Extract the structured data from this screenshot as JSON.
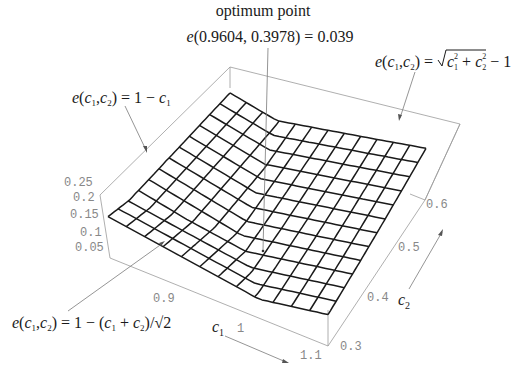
{
  "chart_data": {
    "type": "surface3d",
    "title": "",
    "xlabel": "c1",
    "ylabel": "c2",
    "zlabel": "",
    "x_range": [
      0.85,
      1.1
    ],
    "y_range": [
      0.3,
      0.6
    ],
    "z_range": [
      0.03,
      0.25
    ],
    "x_ticks": [
      "0.9",
      "1",
      "1.1"
    ],
    "y_ticks": [
      "0.3",
      "0.4",
      "0.5",
      "0.6"
    ],
    "z_ticks": [
      "0.05",
      "0.1",
      "0.15",
      "0.2",
      "0.25"
    ],
    "grid_lines": 13,
    "annotations": [
      {
        "id": "optimum",
        "lines": [
          "optimum point",
          "e(0.9604, 0.3978) = 0.039"
        ],
        "point": {
          "c1": 0.9604,
          "c2": 0.3978,
          "e": 0.039
        }
      },
      {
        "id": "region1",
        "text": "e(c1,c2) = 1 − c1"
      },
      {
        "id": "region2",
        "text": "e(c1,c2) = √(c1² + c2²) − 1"
      },
      {
        "id": "region3",
        "text": "e(c1,c2) = 1 − (c1 + c2)/√2"
      }
    ]
  },
  "labels": {
    "optimum_title": "optimum point",
    "optimum_value": "e(0.9604, 0.3978) = 0.039",
    "c1_axis": "c",
    "c1_sub": "1",
    "c2_axis": "c",
    "c2_sub": "2"
  }
}
